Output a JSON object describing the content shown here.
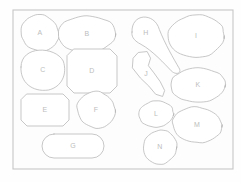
{
  "canvas": {
    "width": 241,
    "height": 182,
    "background_color": "#ffffff",
    "stroke_color": "#b9b9b9",
    "label_color": "#bdbdbd"
  },
  "frame": {
    "name": "outer-border",
    "x": 13,
    "y": 10,
    "width": 220,
    "height": 159,
    "stroke_color": "#c6c6c6"
  },
  "shapes": [
    {
      "id": "A",
      "label": "A",
      "kind": "circle",
      "column": "left",
      "cx": 40,
      "cy": 33,
      "rx": 19,
      "ry": 18,
      "label_x": 40,
      "label_y": 33
    },
    {
      "id": "B",
      "label": "B",
      "kind": "ellipse",
      "column": "left",
      "cx": 87,
      "cy": 34,
      "rx": 28,
      "ry": 19,
      "label_x": 87,
      "label_y": 34
    },
    {
      "id": "C",
      "label": "C",
      "kind": "blob",
      "column": "left",
      "cx": 43,
      "cy": 70,
      "rx": 22,
      "ry": 20,
      "label_x": 43,
      "label_y": 70
    },
    {
      "id": "D",
      "label": "D",
      "kind": "octagon",
      "column": "left",
      "cx": 92,
      "cy": 71,
      "rx": 25,
      "ry": 22,
      "label_x": 92,
      "label_y": 71
    },
    {
      "id": "E",
      "label": "E",
      "kind": "octagon-wide",
      "column": "left",
      "cx": 45,
      "cy": 110,
      "rx": 24,
      "ry": 16,
      "label_x": 45,
      "label_y": 110
    },
    {
      "id": "F",
      "label": "F",
      "kind": "circle",
      "column": "left",
      "cx": 96,
      "cy": 110,
      "rx": 19,
      "ry": 18,
      "label_x": 96,
      "label_y": 110
    },
    {
      "id": "G",
      "label": "G",
      "kind": "pill",
      "column": "left",
      "cx": 73,
      "cy": 146,
      "rx": 31,
      "ry": 12,
      "label_x": 73,
      "label_y": 146
    },
    {
      "id": "H",
      "label": "H",
      "kind": "teardrop",
      "column": "right",
      "cx": 146,
      "cy": 33,
      "rx": 14,
      "ry": 12,
      "label_x": 146,
      "label_y": 33
    },
    {
      "id": "I",
      "label": "I",
      "kind": "ellipse",
      "column": "right",
      "cx": 196,
      "cy": 36,
      "rx": 29,
      "ry": 21,
      "label_x": 196,
      "label_y": 36
    },
    {
      "id": "J",
      "label": "J",
      "kind": "irregular-blob",
      "column": "right",
      "cx": 148,
      "cy": 74,
      "rx": 17,
      "ry": 22,
      "label_x": 146,
      "label_y": 74
    },
    {
      "id": "K",
      "label": "K",
      "kind": "ellipse",
      "column": "right",
      "cx": 198,
      "cy": 85,
      "rx": 27,
      "ry": 18,
      "label_x": 198,
      "label_y": 85
    },
    {
      "id": "L",
      "label": "L",
      "kind": "ellipse",
      "column": "right",
      "cx": 156,
      "cy": 114,
      "rx": 18,
      "ry": 13,
      "label_x": 156,
      "label_y": 114
    },
    {
      "id": "M",
      "label": "M",
      "kind": "ellipse",
      "column": "right",
      "cx": 197,
      "cy": 125,
      "rx": 25,
      "ry": 18,
      "label_x": 197,
      "label_y": 125
    },
    {
      "id": "N",
      "label": "N",
      "kind": "circle",
      "column": "right",
      "cx": 160,
      "cy": 147,
      "rx": 17,
      "ry": 17,
      "label_x": 160,
      "label_y": 147
    }
  ]
}
